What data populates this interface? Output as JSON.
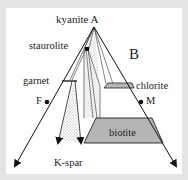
{
  "diagram": {
    "type": "AFM projection",
    "labels": {
      "apex": "kyanite A",
      "staurolite": "staurolite",
      "region": "B",
      "garnet": "garnet",
      "chlorite": "chlorite",
      "F": "F",
      "M": "M",
      "biotite": "biotite",
      "kspar": "K-spar"
    },
    "colors": {
      "background": "#e4e4e4",
      "panel": "#ffffff",
      "line": "#222222",
      "field_fill": "#b5b5b5",
      "stipple": "#9a9a9a"
    }
  }
}
